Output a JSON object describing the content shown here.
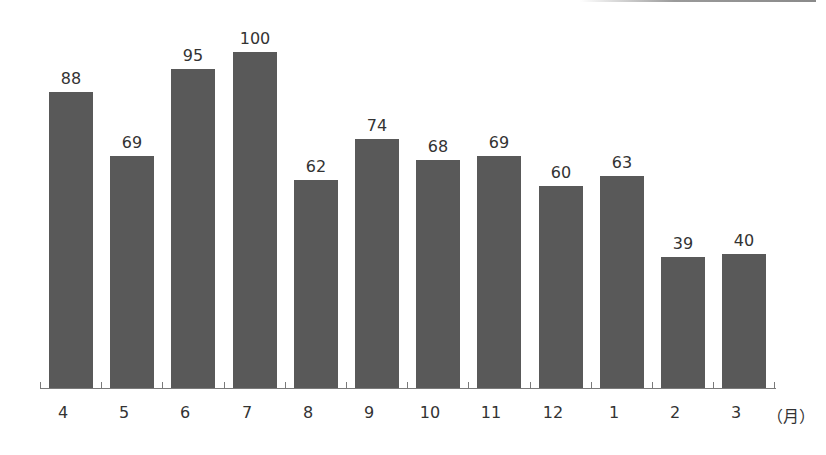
{
  "chart_data": {
    "type": "bar",
    "title": "",
    "xlabel": "(月)",
    "ylabel": "",
    "categories": [
      "4",
      "5",
      "6",
      "7",
      "8",
      "9",
      "10",
      "11",
      "12",
      "1",
      "2",
      "3"
    ],
    "values": [
      88,
      69,
      95,
      100,
      62,
      74,
      68,
      69,
      60,
      63,
      39,
      40
    ],
    "ylim": [
      0,
      100
    ],
    "grid": false,
    "legend": null,
    "data_labels": true,
    "bar_color": "#595959"
  },
  "axis": {
    "unit_label": "（月）"
  }
}
